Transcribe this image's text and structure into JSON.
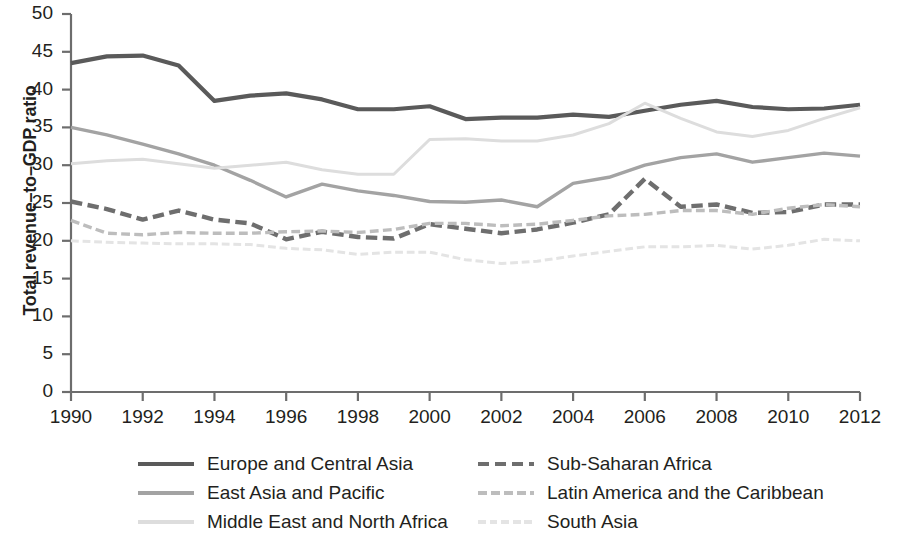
{
  "chart_data": {
    "type": "line",
    "title": "",
    "xlabel": "",
    "ylabel": "Total revenue–to–GDP ratio",
    "xlim": [
      1990,
      2012
    ],
    "ylim": [
      0,
      50
    ],
    "ytick_step": 5,
    "xtick_step": 2,
    "grid": false,
    "legend_position": "bottom",
    "x": [
      1990,
      1991,
      1992,
      1993,
      1994,
      1995,
      1996,
      1997,
      1998,
      1999,
      2000,
      2001,
      2002,
      2003,
      2004,
      2005,
      2006,
      2007,
      2008,
      2009,
      2010,
      2011,
      2012
    ],
    "ytick_labels": [
      "50",
      "45",
      "40",
      "35",
      "30",
      "25",
      "20",
      "15",
      "10",
      "5",
      "0"
    ],
    "ytick_values": [
      50,
      45,
      40,
      35,
      30,
      25,
      20,
      15,
      10,
      5,
      0
    ],
    "xtick_labels": [
      "1990",
      "1992",
      "1994",
      "1996",
      "1998",
      "2000",
      "2002",
      "2004",
      "2006",
      "2008",
      "2010",
      "2012"
    ],
    "xtick_values": [
      1990,
      1992,
      1994,
      1996,
      1998,
      2000,
      2002,
      2004,
      2006,
      2008,
      2010,
      2012
    ],
    "series": [
      {
        "name": "Europe and Central Asia",
        "color": "#5a5a5a",
        "style": "solid",
        "width": 4.2,
        "values": [
          43.5,
          44.4,
          44.5,
          43.2,
          38.5,
          39.2,
          39.5,
          38.7,
          37.4,
          37.4,
          37.8,
          36.1,
          36.3,
          36.3,
          36.7,
          36.4,
          37.2,
          38.0,
          38.5,
          37.7,
          37.4,
          37.5,
          38.0
        ]
      },
      {
        "name": "East Asia and Pacific",
        "color": "#a3a3a3",
        "style": "solid",
        "width": 3.4,
        "values": [
          35.0,
          34.0,
          32.8,
          31.5,
          30.0,
          28.0,
          25.8,
          27.5,
          26.6,
          26.0,
          25.2,
          25.1,
          25.4,
          24.5,
          27.6,
          28.4,
          30.0,
          31.0,
          31.5,
          30.4,
          31.0,
          31.6,
          31.2
        ]
      },
      {
        "name": "Middle East and North Africa",
        "color": "#dddddd",
        "style": "solid",
        "width": 3.0,
        "values": [
          30.2,
          30.6,
          30.8,
          30.2,
          29.6,
          30.0,
          30.4,
          29.4,
          28.8,
          28.8,
          33.4,
          33.5,
          33.2,
          33.2,
          34.0,
          35.5,
          38.2,
          36.2,
          34.4,
          33.8,
          34.6,
          36.2,
          37.6
        ]
      },
      {
        "name": "Sub-Saharan Africa",
        "color": "#6e6e6e",
        "style": "dashed",
        "width": 4.4,
        "values": [
          25.2,
          24.2,
          22.8,
          24.0,
          22.8,
          22.3,
          20.2,
          21.2,
          20.5,
          20.3,
          22.2,
          21.6,
          21.0,
          21.5,
          22.4,
          23.5,
          28.2,
          24.5,
          24.8,
          23.7,
          23.8,
          24.8,
          24.8
        ]
      },
      {
        "name": "Latin America and the Caribbean",
        "color": "#bdbdbd",
        "style": "dashed",
        "width": 3.4,
        "values": [
          22.7,
          21.0,
          20.8,
          21.1,
          21.0,
          21.0,
          21.2,
          21.3,
          21.1,
          21.5,
          22.3,
          22.3,
          22.0,
          22.2,
          22.7,
          23.3,
          23.5,
          24.0,
          24.0,
          23.5,
          24.3,
          24.8,
          24.5
        ]
      },
      {
        "name": "South Asia",
        "color": "#e4e4e4",
        "style": "dashed",
        "width": 3.0,
        "values": [
          20.0,
          19.8,
          19.7,
          19.6,
          19.6,
          19.5,
          19.0,
          18.8,
          18.2,
          18.5,
          18.5,
          17.5,
          17.0,
          17.3,
          18.0,
          18.6,
          19.2,
          19.2,
          19.4,
          18.9,
          19.4,
          20.2,
          20.0
        ]
      }
    ]
  },
  "legend": {
    "rows": [
      [
        {
          "label": "Europe and Central Asia",
          "series_index": 0
        },
        {
          "label": "Sub-Saharan Africa",
          "series_index": 3
        }
      ],
      [
        {
          "label": "East Asia and Pacific",
          "series_index": 1
        },
        {
          "label": "Latin America and the Caribbean",
          "series_index": 4
        }
      ],
      [
        {
          "label": "Middle East and North Africa",
          "series_index": 2
        },
        {
          "label": "South Asia",
          "series_index": 5
        }
      ]
    ]
  },
  "axis": {
    "color": "#6d6d6d"
  }
}
